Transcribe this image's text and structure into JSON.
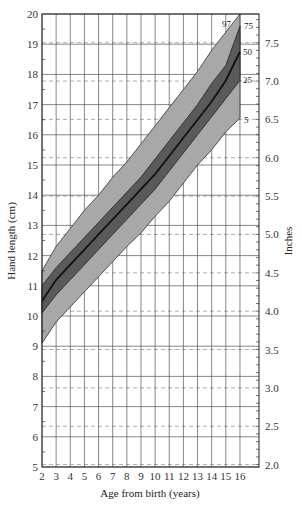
{
  "chart_data": {
    "type": "area",
    "title": "",
    "xlabel": "Age from birth (years)",
    "ylabel": "Hand length (cm)",
    "y2label": "Inches",
    "x": [
      2,
      3,
      4,
      5,
      6,
      7,
      8,
      9,
      10,
      11,
      12,
      13,
      14,
      15,
      16
    ],
    "xlim": [
      2,
      17.5
    ],
    "ylim": [
      5,
      20
    ],
    "y2lim": [
      1.97,
      7.87
    ],
    "xticks": [
      "2",
      "3",
      "4",
      "5",
      "6",
      "7",
      "8",
      "9",
      "10",
      "11",
      "12",
      "13",
      "14",
      "15",
      "16"
    ],
    "yticks": [
      "5",
      "6",
      "7",
      "8",
      "9",
      "10",
      "11",
      "12",
      "13",
      "14",
      "15",
      "16",
      "17",
      "18",
      "19",
      "20"
    ],
    "y2ticks": [
      "2.0",
      "2.5",
      "3.0",
      "3.5",
      "4.0",
      "4.5",
      "5.0",
      "5.5",
      "6.0",
      "6.5",
      "7.0",
      "7.5"
    ],
    "grid": true,
    "series": [
      {
        "name": "97",
        "values": [
          11.5,
          12.3,
          12.9,
          13.5,
          14.0,
          14.6,
          15.1,
          15.7,
          16.3,
          16.9,
          17.5,
          18.1,
          18.8,
          19.4,
          20.0
        ]
      },
      {
        "name": "75",
        "values": [
          11.0,
          11.6,
          12.1,
          12.6,
          13.1,
          13.6,
          14.1,
          14.6,
          15.2,
          15.8,
          16.4,
          17.0,
          17.7,
          18.3,
          19.6
        ]
      },
      {
        "name": "50",
        "values": [
          10.5,
          11.2,
          11.7,
          12.2,
          12.7,
          13.2,
          13.7,
          14.2,
          14.7,
          15.3,
          15.9,
          16.5,
          17.1,
          17.8,
          18.75
        ]
      },
      {
        "name": "25",
        "values": [
          10.1,
          10.7,
          11.2,
          11.7,
          12.2,
          12.7,
          13.2,
          13.7,
          14.2,
          14.8,
          15.4,
          16.0,
          16.6,
          17.2,
          17.8
        ]
      },
      {
        "name": "5",
        "values": [
          9.1,
          9.8,
          10.3,
          10.8,
          11.3,
          11.8,
          12.3,
          12.75,
          13.3,
          13.8,
          14.4,
          15.0,
          15.5,
          16.1,
          16.55
        ]
      }
    ],
    "legend_position": "inline-right",
    "annotations": [
      "97",
      "75",
      "50",
      "25",
      "5"
    ]
  },
  "labels": {
    "xlabel": "Age from birth (years)",
    "ylabel": "Hand length (cm)",
    "y2label": "Inches",
    "p97": "97",
    "p75": "75",
    "p50": "50",
    "p25": "25",
    "p5": "5"
  },
  "colors": {
    "outer_band": "#a8a8a8",
    "inner_band": "#5a5a5a",
    "median_line": "#111111",
    "grid": "#555555",
    "dashed_grid": "#888888"
  }
}
